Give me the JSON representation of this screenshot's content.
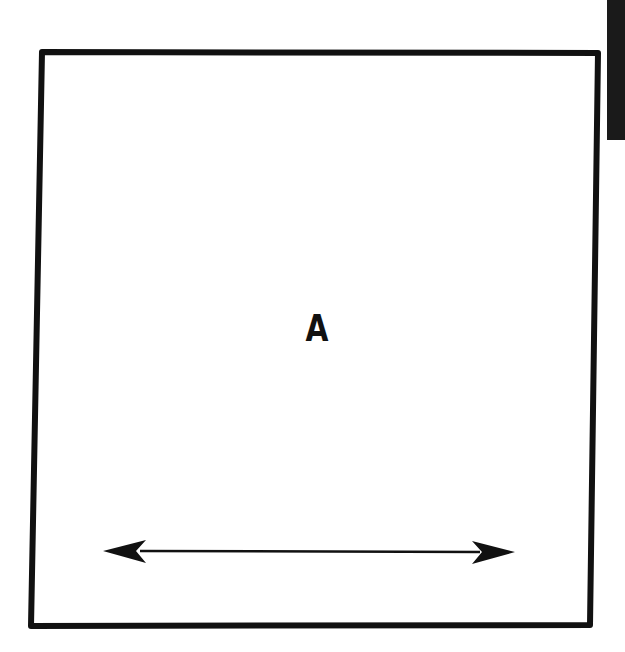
{
  "diagram": {
    "square_label": "A",
    "elements": [
      {
        "type": "square",
        "description": "large outlined square"
      },
      {
        "type": "label",
        "text": "A",
        "position": "center"
      },
      {
        "type": "double-headed-arrow",
        "orientation": "horizontal",
        "position": "near bottom inside square"
      },
      {
        "type": "black-bar",
        "position": "top-right edge"
      }
    ],
    "colors": {
      "stroke": "#111111",
      "background": "#ffffff",
      "bar": "#1a1a1a"
    }
  }
}
